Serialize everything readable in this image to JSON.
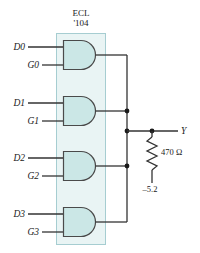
{
  "figure": {
    "type": "logic-circuit-schematic",
    "background_color": "#ffffff",
    "wire_color": "#333333",
    "gate_fill_color": "#cbe7e6",
    "gate_stroke_color": "#4a4a4a",
    "package_fill_color": "#e6f2f2",
    "package_stroke_color": "#9fc8cc"
  },
  "package": {
    "name": "package-outline",
    "title_line1": "ECL",
    "title_line2": "'104"
  },
  "gates": [
    {
      "name": "and-gate-0",
      "type": "AND",
      "inputs": [
        {
          "label": "D0",
          "name": "input-d0"
        },
        {
          "label": "G0",
          "name": "input-g0"
        }
      ]
    },
    {
      "name": "and-gate-1",
      "type": "AND",
      "inputs": [
        {
          "label": "D1",
          "name": "input-d1"
        },
        {
          "label": "G1",
          "name": "input-g1"
        }
      ]
    },
    {
      "name": "and-gate-2",
      "type": "AND",
      "inputs": [
        {
          "label": "D2",
          "name": "input-d2"
        },
        {
          "label": "G2",
          "name": "input-g2"
        }
      ]
    },
    {
      "name": "and-gate-3",
      "type": "AND",
      "inputs": [
        {
          "label": "D3",
          "name": "input-d3"
        },
        {
          "label": "G3",
          "name": "input-g3"
        }
      ]
    }
  ],
  "output": {
    "label": "Y",
    "name": "output-y"
  },
  "resistor": {
    "label": "470 Ω",
    "name": "pulldown-resistor"
  },
  "supply": {
    "label": "–5.2",
    "name": "supply-rail"
  }
}
